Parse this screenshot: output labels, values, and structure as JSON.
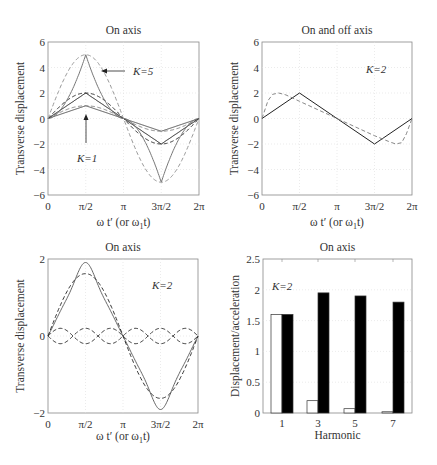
{
  "chart_data": [
    {
      "id": "p1",
      "type": "line",
      "title": "On axis",
      "xlabel": "ω t' (or ω1 t)",
      "ylabel": "Transverse displacement",
      "xlim": [
        0,
        6.2832
      ],
      "ylim": [
        -6,
        6
      ],
      "xticks": [
        0,
        1.5708,
        3.1416,
        4.7124,
        6.2832
      ],
      "xtick_labels": [
        "0",
        "π/2",
        "π",
        "3π/2",
        "2π"
      ],
      "yticks": [
        -6,
        -4,
        -2,
        0,
        2,
        4,
        6
      ],
      "ytick_labels": [
        "−6",
        "−4",
        "−2",
        "0",
        "2",
        "4",
        "6"
      ],
      "grid": true,
      "annotations": [
        {
          "text": "K=5",
          "points_to": [
            1.9,
            4.0
          ]
        },
        {
          "text": "K=1",
          "points_to": [
            1.57,
            1.0
          ]
        }
      ],
      "series": [
        {
          "name": "K=1 triangular (exact)",
          "style": "solid",
          "color": "#555555",
          "kind": "triangle",
          "K": 1
        },
        {
          "name": "K=1 sinusoidal",
          "style": "dashed",
          "color": "#888888",
          "kind": "sine",
          "K": 1
        },
        {
          "name": "K=2 triangular (exact)",
          "style": "solid",
          "color": "#222222",
          "kind": "triangle",
          "K": 2
        },
        {
          "name": "K=2 sinusoidal",
          "style": "dashed",
          "color": "#333333",
          "kind": "sine",
          "K": 2
        },
        {
          "name": "K=5 cusped (exact)",
          "style": "solid",
          "color": "#777777",
          "kind": "cusp",
          "K": 5
        },
        {
          "name": "K=5 sinusoidal",
          "style": "dashed",
          "color": "#999999",
          "kind": "sine",
          "K": 5
        }
      ]
    },
    {
      "id": "p2",
      "type": "line",
      "title": "On and off axis",
      "xlabel": "ω t' (or ω1 t)",
      "ylabel": "Transverse displacement",
      "xlim": [
        0,
        6.2832
      ],
      "ylim": [
        -6,
        6
      ],
      "xticks": [
        0,
        1.5708,
        3.1416,
        4.7124,
        6.2832
      ],
      "xtick_labels": [
        "0",
        "π/2",
        "π",
        "3π/2",
        "2π"
      ],
      "yticks": [
        -6,
        -4,
        -2,
        0,
        2,
        4,
        6
      ],
      "ytick_labels": [
        "−6",
        "−4",
        "−2",
        "0",
        "2",
        "4",
        "6"
      ],
      "grid": true,
      "annotations": [
        {
          "text": "K=2"
        }
      ],
      "series": [
        {
          "name": "On axis (K=2)",
          "style": "solid",
          "color": "#222222",
          "x": [
            0,
            1.5708,
            4.7124,
            6.2832
          ],
          "y": [
            0,
            2,
            -2,
            0
          ]
        },
        {
          "name": "Off axis (K=2)",
          "style": "dashed",
          "color": "#888888",
          "x": [
            0,
            0.25,
            0.45,
            0.7,
            1.0,
            1.5708,
            3.1416,
            4.7124,
            5.3,
            5.6,
            5.85,
            6.05,
            6.2832
          ],
          "y": [
            0,
            1.4,
            1.9,
            2.0,
            1.85,
            1.35,
            0.0,
            -1.35,
            -1.8,
            -2.0,
            -1.9,
            -1.2,
            0
          ]
        }
      ]
    },
    {
      "id": "p3",
      "type": "line",
      "title": "On axis",
      "xlabel": "ω t' (or ω1 t)",
      "ylabel": "Transverse displacement",
      "xlim": [
        0,
        6.2832
      ],
      "ylim": [
        -2,
        2
      ],
      "xticks": [
        0,
        1.5708,
        3.1416,
        4.7124,
        6.2832
      ],
      "xtick_labels": [
        "0",
        "π/2",
        "π",
        "3π/2",
        "2π"
      ],
      "yticks": [
        -2,
        0,
        2
      ],
      "ytick_labels": [
        "−2",
        "0",
        "2"
      ],
      "grid": true,
      "annotations": [
        {
          "text": "K=2"
        }
      ],
      "series": [
        {
          "name": "Sum of harmonics",
          "style": "solid",
          "color": "#666666",
          "harmonics": [
            [
              1,
              1.62
            ],
            [
              3,
              -0.2
            ],
            [
              5,
              0.07
            ],
            [
              7,
              -0.02
            ]
          ]
        },
        {
          "name": "Fundamental",
          "style": "dashed",
          "color": "#333333",
          "harmonics": [
            [
              1,
              1.62
            ]
          ]
        },
        {
          "name": "3rd harmonic (+)",
          "style": "dashed",
          "color": "#333333",
          "harmonics": [
            [
              3,
              0.2
            ]
          ]
        },
        {
          "name": "3rd harmonic (−)",
          "style": "dashed",
          "color": "#333333",
          "harmonics": [
            [
              3,
              -0.2
            ]
          ]
        }
      ]
    },
    {
      "id": "p4",
      "type": "bar",
      "title": "On axis",
      "xlabel": "Harmonic",
      "ylabel": "Displacement/acceleration",
      "categories": [
        "1",
        "3",
        "5",
        "7"
      ],
      "ylim": [
        0,
        2.5
      ],
      "yticks": [
        0,
        0.5,
        1,
        1.5,
        2,
        2.5
      ],
      "ytick_labels": [
        "0",
        "0.5",
        "1",
        "1.5",
        "2",
        "2.5"
      ],
      "grid": true,
      "annotations": [
        {
          "text": "K=2"
        }
      ],
      "series": [
        {
          "name": "Displacement",
          "color": "#ffffff",
          "values": [
            1.6,
            0.2,
            0.07,
            0.02
          ]
        },
        {
          "name": "Acceleration",
          "color": "#000000",
          "values": [
            1.6,
            1.95,
            1.9,
            1.8
          ]
        }
      ]
    }
  ],
  "layout": {
    "panels": [
      {
        "left": 48,
        "top": 42,
        "right": 199,
        "bottom": 195
      },
      {
        "left": 262,
        "top": 42,
        "right": 412,
        "bottom": 195
      },
      {
        "left": 48,
        "top": 259,
        "right": 198,
        "bottom": 413
      },
      {
        "left": 263,
        "top": 259,
        "right": 412,
        "bottom": 413
      }
    ]
  }
}
